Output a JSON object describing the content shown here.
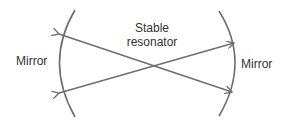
{
  "diagram": {
    "title_line1": "Stable",
    "title_line2": "resonator",
    "left_label": "Mirror",
    "right_label": "Mirror",
    "stroke_color": "#6e6e6e",
    "text_color": "#333333"
  }
}
